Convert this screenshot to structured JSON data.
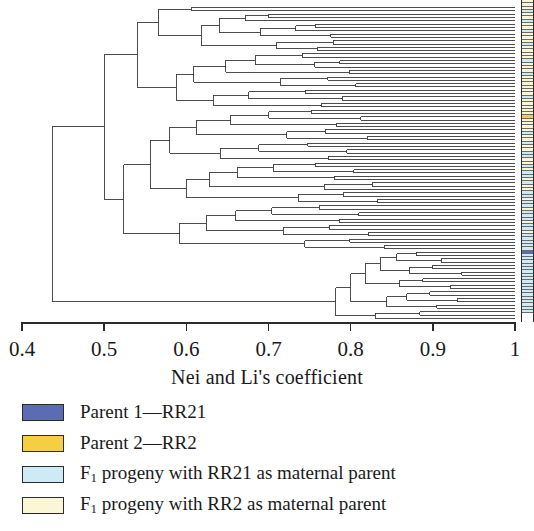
{
  "axis": {
    "title": "Nei and Li's coefficient",
    "ticks": [
      {
        "label": "0.4",
        "value": 0.4
      },
      {
        "label": "0.5",
        "value": 0.5
      },
      {
        "label": "0.6",
        "value": 0.6
      },
      {
        "label": "0.7",
        "value": 0.7
      },
      {
        "label": "0.8",
        "value": 0.8
      },
      {
        "label": "0.9",
        "value": 0.9
      },
      {
        "label": "1",
        "value": 1.0
      }
    ],
    "min": 0.4,
    "max": 1.0
  },
  "legend": [
    {
      "label_prefix": "Parent 1",
      "label": "Parent 1—RR21",
      "color": "#5c6cb4",
      "key": "parent1"
    },
    {
      "label_prefix": "Parent 2",
      "label": "Parent 2—RR2",
      "color": "#f5ce42",
      "key": "parent2"
    },
    {
      "label_prefix": "F",
      "label_sub": "1",
      "label_rest": " progeny with RR21 as maternal parent",
      "label": "F1 progeny with RR21 as maternal parent",
      "color": "#cdeaf5",
      "key": "f1_rr21"
    },
    {
      "label_prefix": "F",
      "label_sub": "1",
      "label_rest": " progeny with RR2 as maternal parent",
      "label": "F1 progeny with RR2 as maternal parent",
      "color": "#fbf6d5",
      "key": "f1_rr2"
    }
  ],
  "chart_data": {
    "type": "dendrogram",
    "title": "",
    "xlabel": "Nei and Li's coefficient",
    "ylabel": "",
    "xlim": [
      0.4,
      1.0
    ],
    "grid": false,
    "legend_position": "below",
    "leaf_count": 95,
    "root_height": 0.437,
    "leaf_categories": [
      "f1_rr2",
      "f1_rr2",
      "f1_rr2",
      "f1_rr21",
      "f1_rr2",
      "f1_rr2",
      "f1_rr21",
      "f1_rr2",
      "f1_rr2",
      "f1_rr21",
      "f1_rr2",
      "f1_rr2",
      "f1_rr2",
      "f1_rr21",
      "f1_rr2",
      "f1_rr2",
      "f1_rr2",
      "f1_rr2",
      "f1_rr21",
      "f1_rr2",
      "f1_rr2",
      "f1_rr2",
      "f1_rr21",
      "f1_rr2",
      "f1_rr2",
      "f1_rr2",
      "f1_rr2",
      "f1_rr2",
      "f1_rr2",
      "f1_rr21",
      "f1_rr2",
      "f1_rr2",
      "f1_rr2",
      "f1_rr2",
      "f1_rr2",
      "parent2",
      "f1_rr2",
      "f1_rr2",
      "f1_rr2",
      "f1_rr2",
      "f1_rr21",
      "f1_rr2",
      "f1_rr2",
      "f1_rr21",
      "f1_rr2",
      "f1_rr2",
      "f1_rr21",
      "f1_rr21",
      "f1_rr2",
      "f1_rr2",
      "f1_rr21",
      "f1_rr2",
      "f1_rr21",
      "f1_rr21",
      "f1_rr2",
      "f1_rr21",
      "f1_rr2",
      "f1_rr2",
      "f1_rr21",
      "f1_rr21",
      "f1_rr2",
      "f1_rr21",
      "f1_rr21",
      "f1_rr2",
      "f1_rr21",
      "f1_rr21",
      "f1_rr21",
      "f1_rr2",
      "f1_rr21",
      "f1_rr21",
      "f1_rr2",
      "f1_rr21",
      "f1_rr21",
      "f1_rr21",
      "f1_rr21",
      "f1_rr21",
      "parent1",
      "f1_rr21",
      "f1_rr21",
      "f1_rr21",
      "f1_rr21",
      "f1_rr21",
      "f1_rr21",
      "f1_rr21",
      "f1_rr21",
      "f1_rr21",
      "f1_rr21",
      "f1_rr21",
      "f1_rr21",
      "f1_rr21",
      "f1_rr21",
      "f1_rr21",
      "f1_rr21",
      "f1_rr21",
      "f1_rr21"
    ],
    "merges": [
      {
        "id": 95,
        "left": 0,
        "right": 1,
        "height": 0.606
      },
      {
        "id": 96,
        "left": 2,
        "right": 3,
        "height": 0.7
      },
      {
        "id": 97,
        "left": 4,
        "right": 96,
        "height": 0.672
      },
      {
        "id": 98,
        "left": 5,
        "right": 6,
        "height": 0.757
      },
      {
        "id": 99,
        "left": 7,
        "right": 98,
        "height": 0.733
      },
      {
        "id": 100,
        "left": 8,
        "right": 9,
        "height": 0.776
      },
      {
        "id": 101,
        "left": 99,
        "right": 100,
        "height": 0.69
      },
      {
        "id": 102,
        "left": 97,
        "right": 101,
        "height": 0.64
      },
      {
        "id": 103,
        "left": 10,
        "right": 11,
        "height": 0.779
      },
      {
        "id": 104,
        "left": 12,
        "right": 13,
        "height": 0.76
      },
      {
        "id": 105,
        "left": 103,
        "right": 104,
        "height": 0.71
      },
      {
        "id": 106,
        "left": 102,
        "right": 105,
        "height": 0.618
      },
      {
        "id": 107,
        "left": 95,
        "right": 106,
        "height": 0.566
      },
      {
        "id": 108,
        "left": 14,
        "right": 15,
        "height": 0.741
      },
      {
        "id": 109,
        "left": 16,
        "right": 17,
        "height": 0.787
      },
      {
        "id": 110,
        "left": 18,
        "right": 109,
        "height": 0.756
      },
      {
        "id": 111,
        "left": 108,
        "right": 110,
        "height": 0.684
      },
      {
        "id": 112,
        "left": 19,
        "right": 20,
        "height": 0.798
      },
      {
        "id": 113,
        "left": 111,
        "right": 112,
        "height": 0.648
      },
      {
        "id": 114,
        "left": 21,
        "right": 22,
        "height": 0.772
      },
      {
        "id": 115,
        "left": 23,
        "right": 24,
        "height": 0.806
      },
      {
        "id": 116,
        "left": 114,
        "right": 115,
        "height": 0.714
      },
      {
        "id": 117,
        "left": 113,
        "right": 116,
        "height": 0.609
      },
      {
        "id": 118,
        "left": 25,
        "right": 26,
        "height": 0.745
      },
      {
        "id": 119,
        "left": 27,
        "right": 28,
        "height": 0.79
      },
      {
        "id": 120,
        "left": 118,
        "right": 119,
        "height": 0.676
      },
      {
        "id": 121,
        "left": 29,
        "right": 30,
        "height": 0.764
      },
      {
        "id": 122,
        "left": 120,
        "right": 121,
        "height": 0.633
      },
      {
        "id": 123,
        "left": 117,
        "right": 122,
        "height": 0.588
      },
      {
        "id": 124,
        "left": 107,
        "right": 123,
        "height": 0.54
      },
      {
        "id": 125,
        "left": 31,
        "right": 32,
        "height": 0.752
      },
      {
        "id": 126,
        "left": 33,
        "right": 34,
        "height": 0.812
      },
      {
        "id": 127,
        "left": 125,
        "right": 126,
        "height": 0.7
      },
      {
        "id": 128,
        "left": 35,
        "right": 36,
        "height": 0.783
      },
      {
        "id": 129,
        "left": 127,
        "right": 128,
        "height": 0.654
      },
      {
        "id": 130,
        "left": 37,
        "right": 38,
        "height": 0.769
      },
      {
        "id": 131,
        "left": 39,
        "right": 40,
        "height": 0.82
      },
      {
        "id": 132,
        "left": 130,
        "right": 131,
        "height": 0.722
      },
      {
        "id": 133,
        "left": 129,
        "right": 132,
        "height": 0.612
      },
      {
        "id": 134,
        "left": 41,
        "right": 42,
        "height": 0.748
      },
      {
        "id": 135,
        "left": 43,
        "right": 44,
        "height": 0.795
      },
      {
        "id": 136,
        "left": 134,
        "right": 135,
        "height": 0.688
      },
      {
        "id": 137,
        "left": 45,
        "right": 46,
        "height": 0.773
      },
      {
        "id": 138,
        "left": 136,
        "right": 137,
        "height": 0.641
      },
      {
        "id": 139,
        "left": 133,
        "right": 138,
        "height": 0.58
      },
      {
        "id": 140,
        "left": 47,
        "right": 48,
        "height": 0.757
      },
      {
        "id": 141,
        "left": 49,
        "right": 50,
        "height": 0.804
      },
      {
        "id": 142,
        "left": 140,
        "right": 141,
        "height": 0.706
      },
      {
        "id": 143,
        "left": 51,
        "right": 52,
        "height": 0.78
      },
      {
        "id": 144,
        "left": 142,
        "right": 143,
        "height": 0.662
      },
      {
        "id": 145,
        "left": 53,
        "right": 54,
        "height": 0.826
      },
      {
        "id": 146,
        "left": 55,
        "right": 145,
        "height": 0.768
      },
      {
        "id": 147,
        "left": 144,
        "right": 146,
        "height": 0.628
      },
      {
        "id": 148,
        "left": 56,
        "right": 57,
        "height": 0.791
      },
      {
        "id": 149,
        "left": 58,
        "right": 59,
        "height": 0.833
      },
      {
        "id": 150,
        "left": 148,
        "right": 149,
        "height": 0.736
      },
      {
        "id": 151,
        "left": 147,
        "right": 150,
        "height": 0.6
      },
      {
        "id": 152,
        "left": 139,
        "right": 151,
        "height": 0.556
      },
      {
        "id": 153,
        "left": 60,
        "right": 61,
        "height": 0.762
      },
      {
        "id": 154,
        "left": 62,
        "right": 63,
        "height": 0.81
      },
      {
        "id": 155,
        "left": 153,
        "right": 154,
        "height": 0.704
      },
      {
        "id": 156,
        "left": 64,
        "right": 65,
        "height": 0.786
      },
      {
        "id": 157,
        "left": 155,
        "right": 156,
        "height": 0.66
      },
      {
        "id": 158,
        "left": 66,
        "right": 67,
        "height": 0.774
      },
      {
        "id": 159,
        "left": 68,
        "right": 69,
        "height": 0.822
      },
      {
        "id": 160,
        "left": 158,
        "right": 159,
        "height": 0.718
      },
      {
        "id": 161,
        "left": 157,
        "right": 160,
        "height": 0.624
      },
      {
        "id": 162,
        "left": 70,
        "right": 71,
        "height": 0.799
      },
      {
        "id": 163,
        "left": 72,
        "right": 73,
        "height": 0.841
      },
      {
        "id": 164,
        "left": 162,
        "right": 163,
        "height": 0.744
      },
      {
        "id": 165,
        "left": 161,
        "right": 164,
        "height": 0.592
      },
      {
        "id": 166,
        "left": 152,
        "right": 165,
        "height": 0.524
      },
      {
        "id": 167,
        "left": 124,
        "right": 166,
        "height": 0.5
      },
      {
        "id": 168,
        "left": 74,
        "right": 75,
        "height": 0.88
      },
      {
        "id": 169,
        "left": 76,
        "right": 77,
        "height": 0.91
      },
      {
        "id": 170,
        "left": 168,
        "right": 169,
        "height": 0.856
      },
      {
        "id": 171,
        "left": 78,
        "right": 79,
        "height": 0.9
      },
      {
        "id": 172,
        "left": 80,
        "right": 81,
        "height": 0.935
      },
      {
        "id": 173,
        "left": 171,
        "right": 172,
        "height": 0.872
      },
      {
        "id": 174,
        "left": 170,
        "right": 173,
        "height": 0.836
      },
      {
        "id": 175,
        "left": 82,
        "right": 83,
        "height": 0.888
      },
      {
        "id": 176,
        "left": 84,
        "right": 85,
        "height": 0.922
      },
      {
        "id": 177,
        "left": 175,
        "right": 176,
        "height": 0.86
      },
      {
        "id": 178,
        "left": 174,
        "right": 177,
        "height": 0.818
      },
      {
        "id": 179,
        "left": 86,
        "right": 87,
        "height": 0.896
      },
      {
        "id": 180,
        "left": 88,
        "right": 89,
        "height": 0.93
      },
      {
        "id": 181,
        "left": 179,
        "right": 180,
        "height": 0.868
      },
      {
        "id": 182,
        "left": 90,
        "right": 91,
        "height": 0.905
      },
      {
        "id": 183,
        "left": 181,
        "right": 182,
        "height": 0.844
      },
      {
        "id": 184,
        "left": 178,
        "right": 183,
        "height": 0.8
      },
      {
        "id": 185,
        "left": 92,
        "right": 93,
        "height": 0.884
      },
      {
        "id": 186,
        "left": 185,
        "right": 94,
        "height": 0.83
      },
      {
        "id": 187,
        "left": 184,
        "right": 186,
        "height": 0.782
      },
      {
        "id": 188,
        "left": 167,
        "right": 187,
        "height": 0.437
      }
    ]
  }
}
